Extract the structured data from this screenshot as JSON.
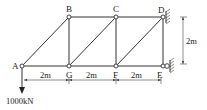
{
  "diagram": {
    "type": "truss",
    "nodes": {
      "A": {
        "label": "A",
        "x": 22,
        "y": 66
      },
      "B": {
        "label": "B",
        "x": 69,
        "y": 17
      },
      "C": {
        "label": "C",
        "x": 116,
        "y": 17
      },
      "D": {
        "label": "D",
        "x": 163,
        "y": 17
      },
      "E": {
        "label": "E",
        "x": 163,
        "y": 66
      },
      "F": {
        "label": "F",
        "x": 116,
        "y": 66
      },
      "G": {
        "label": "G",
        "x": 69,
        "y": 66
      }
    },
    "members": [
      [
        "A",
        "B"
      ],
      [
        "B",
        "C"
      ],
      [
        "C",
        "D"
      ],
      [
        "A",
        "G"
      ],
      [
        "G",
        "F"
      ],
      [
        "F",
        "E"
      ],
      [
        "B",
        "G"
      ],
      [
        "C",
        "F"
      ],
      [
        "D",
        "E"
      ],
      [
        "G",
        "C"
      ],
      [
        "F",
        "D"
      ]
    ],
    "supports": [
      {
        "node": "D",
        "type": "pin",
        "side": "right"
      },
      {
        "node": "E",
        "type": "roller",
        "side": "right"
      }
    ],
    "load": {
      "node": "A",
      "label": "1000kN",
      "direction": "down"
    },
    "dimensions": {
      "horizontal": [
        "2m",
        "2m",
        "2m"
      ],
      "vertical": "2m"
    }
  }
}
